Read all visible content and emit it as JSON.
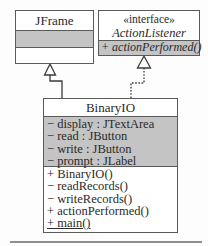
{
  "classes": {
    "jframe": {
      "name": "JFrame",
      "attributes": [],
      "operations": []
    },
    "action_listener": {
      "stereotype": "«interface»",
      "name": "ActionListener",
      "operations": [
        "+ actionPerformed()"
      ]
    },
    "binary_io": {
      "name": "BinaryIO",
      "attributes": [
        "− display : JTextArea",
        "− read : JButton",
        "− write : JButton",
        "− prompt : JLabel"
      ],
      "operations": [
        "+ BinaryIO()",
        "− readRecords()",
        "− writeRecords()",
        "+ actionPerformed()",
        "+ main()"
      ]
    }
  },
  "relationships": [
    {
      "type": "generalization",
      "from": "BinaryIO",
      "to": "JFrame"
    },
    {
      "type": "realization",
      "from": "BinaryIO",
      "to": "ActionListener"
    }
  ],
  "colors": {
    "border": "#5a5a5a",
    "compartment_fill": "#c4c4c4",
    "background": "#fdfdfd"
  }
}
